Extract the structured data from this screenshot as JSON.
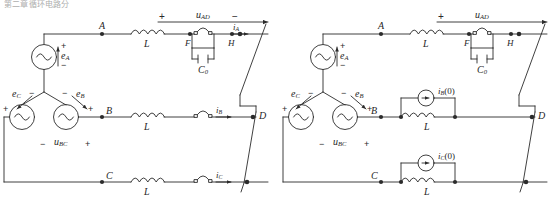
{
  "figure": {
    "header_fragment": "第二章循环电路分析",
    "panels": [
      {
        "id": "left-panel",
        "name": "original-three-phase-circuit",
        "source": {
          "type": "wye-connected-three-phase-source",
          "phases": [
            {
              "label": "e",
              "sub": "A",
              "polarity_plus": "+",
              "polarity_minus": "−"
            },
            {
              "label": "e",
              "sub": "B",
              "polarity_plus": "+",
              "polarity_minus": "−"
            },
            {
              "label": "e",
              "sub": "C",
              "polarity_plus": "+",
              "polarity_minus": "−"
            }
          ]
        },
        "top_voltage": {
          "label": "u",
          "sub": "AD",
          "plus": "+",
          "minus": "−"
        },
        "line_voltage": {
          "label": "u",
          "sub": "BC",
          "plus": "+",
          "minus": "−"
        },
        "nodes": [
          "A",
          "B",
          "C",
          "D",
          "F",
          "H"
        ],
        "inductors": [
          {
            "label": "L",
            "phase": "A"
          },
          {
            "label": "L",
            "phase": "B"
          },
          {
            "label": "L",
            "phase": "C"
          }
        ],
        "capacitor": {
          "label": "C",
          "sub": "0"
        },
        "currents": [
          {
            "label": "i",
            "sub": "A"
          },
          {
            "label": "i",
            "sub": "B"
          },
          {
            "label": "i",
            "sub": "C"
          }
        ],
        "switches": [
          {
            "name": "switch-phase-a",
            "between": "F-H"
          },
          {
            "name": "switch-phase-b",
            "between": "B-D"
          },
          {
            "name": "switch-phase-c",
            "between": "C-bus"
          }
        ]
      },
      {
        "id": "right-panel",
        "name": "equivalent-circuit-with-initial-current-sources",
        "source": {
          "type": "wye-connected-three-phase-source",
          "phases": [
            {
              "label": "e",
              "sub": "A",
              "polarity_plus": "+",
              "polarity_minus": "−"
            },
            {
              "label": "e",
              "sub": "B",
              "polarity_plus": "+",
              "polarity_minus": "−"
            },
            {
              "label": "e",
              "sub": "C",
              "polarity_plus": "+",
              "polarity_minus": "−"
            }
          ]
        },
        "top_voltage": {
          "label": "u",
          "sub": "AD",
          "plus": "+",
          "minus": "−"
        },
        "line_voltage": {
          "label": "u",
          "sub": "BC",
          "plus": "+",
          "minus": "−"
        },
        "nodes": [
          "A",
          "B",
          "C",
          "D",
          "F",
          "H"
        ],
        "inductors": [
          {
            "label": "L",
            "phase": "A"
          },
          {
            "label": "L",
            "phase": "B"
          },
          {
            "label": "L",
            "phase": "C"
          }
        ],
        "capacitor": {
          "label": "C",
          "sub": "0"
        },
        "current_sources": [
          {
            "label": "i",
            "sub": "B",
            "arg": "(0)"
          },
          {
            "label": "i",
            "sub": "C",
            "arg": "(0)"
          }
        ],
        "switches": [
          {
            "name": "switch-phase-a",
            "between": "F-H"
          }
        ]
      }
    ],
    "colors": {
      "line": "#2b2b2b",
      "text": "#1f1f1f",
      "background": "#ffffff"
    }
  }
}
